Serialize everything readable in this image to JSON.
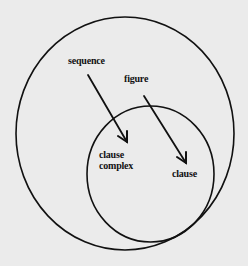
{
  "diagram": {
    "type": "nested-ellipses-with-arrows",
    "background_color": "#ebebeb",
    "stroke_color": "#111111",
    "outer_ellipse": {
      "cx": 125,
      "cy": 133.5,
      "rx": 109,
      "ry": 116.5
    },
    "inner_ellipse": {
      "cx": 150.5,
      "cy": 174,
      "rx": 63.5,
      "ry": 68
    },
    "labels": {
      "sequence": "sequence",
      "figure": "figure",
      "clause_complex_line1": "clause",
      "clause_complex_line2": "complex",
      "clause": "clause"
    },
    "arrows": [
      {
        "from": "sequence",
        "to": "clause complex",
        "x1": 88,
        "y1": 75,
        "x2": 127,
        "y2": 142
      },
      {
        "from": "figure",
        "to": "clause",
        "x1": 144,
        "y1": 96,
        "x2": 186,
        "y2": 163
      }
    ]
  }
}
